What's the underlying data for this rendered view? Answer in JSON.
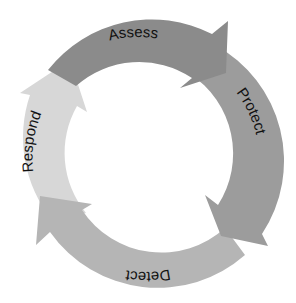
{
  "diagram": {
    "type": "cycle",
    "center": [
      147,
      158
    ],
    "outer_radius": 132,
    "inner_radius": 95,
    "segments": [
      {
        "label": "Assess",
        "color": "#8a8a8a",
        "start_deg": 210,
        "end_deg": 312,
        "label_deg": 270,
        "flip": false
      },
      {
        "label": "Protect",
        "color": "#9b9b9b",
        "start_deg": 300,
        "end_deg": 400,
        "label_deg": 356,
        "flip": false
      },
      {
        "label": "Detect",
        "color": "#b4b4b4",
        "start_deg": 30,
        "end_deg": 140,
        "label_deg": 90,
        "flip": true
      },
      {
        "label": "Respond",
        "color": "#d6d6d6",
        "start_deg": 130,
        "end_deg": 226,
        "label_deg": 178,
        "flip": true
      }
    ]
  }
}
